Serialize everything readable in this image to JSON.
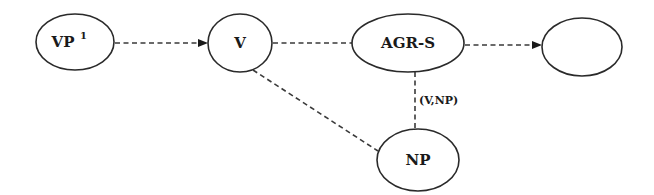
{
  "diagram": {
    "type": "directed-graph",
    "nodes": [
      {
        "id": "vp1",
        "label": "VP",
        "superscript": "1"
      },
      {
        "id": "v",
        "label": "V"
      },
      {
        "id": "agrs",
        "label": "AGR-S"
      },
      {
        "id": "empty",
        "label": ""
      },
      {
        "id": "np",
        "label": "NP"
      }
    ],
    "edges": [
      {
        "from": "vp1",
        "to": "v",
        "style": "dashed",
        "arrow": true,
        "label": ""
      },
      {
        "from": "v",
        "to": "agrs",
        "style": "dashed",
        "arrow": false,
        "label": ""
      },
      {
        "from": "agrs",
        "to": "empty",
        "style": "dashed",
        "arrow": true,
        "label": ""
      },
      {
        "from": "v",
        "to": "np",
        "style": "dashed",
        "arrow": false,
        "label": ""
      },
      {
        "from": "agrs",
        "to": "np",
        "style": "dashed",
        "arrow": false,
        "label": "(V,NP)"
      }
    ]
  },
  "colors": {
    "stroke": "#2a2a2a",
    "edge": "#3a3a3a",
    "background": "#ffffff"
  }
}
